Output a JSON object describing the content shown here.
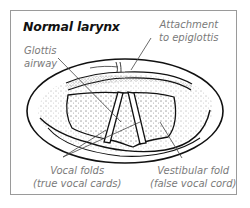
{
  "figure": {
    "title": "Normal larynx",
    "labels": {
      "glottis_line1": "Glottis",
      "glottis_line2": "airway",
      "attachment_line1": "Attachment",
      "attachment_line2": "to epiglottis",
      "vocal_line1": "Vocal folds",
      "vocal_line2": "(true vocal cards)",
      "vestibular_line1": "Vestibular fold",
      "vestibular_line2": "(false vocal cord)"
    },
    "colors": {
      "border": "#9a9a9a",
      "ink": "#111111",
      "label": "#7a7a7a"
    }
  }
}
